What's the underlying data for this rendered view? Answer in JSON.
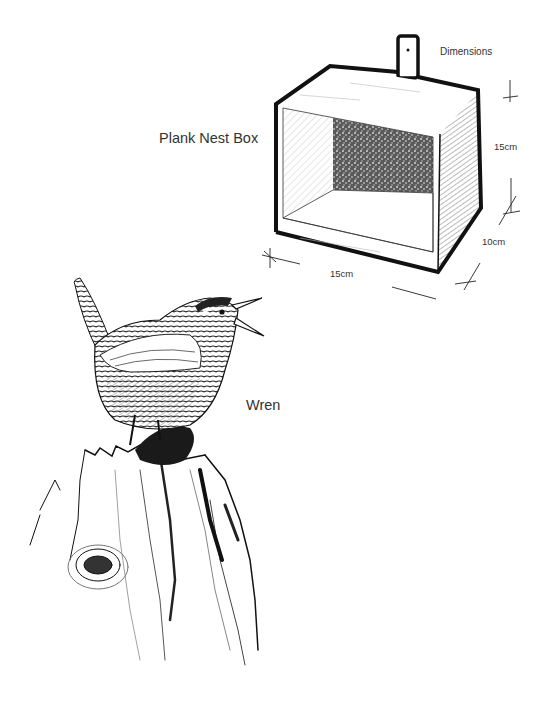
{
  "illustration": {
    "nest_box": {
      "title": "Plank Nest Box",
      "dimensions_heading": "Dimensions",
      "height": "15cm",
      "width": "15cm",
      "depth": "10cm"
    },
    "bird": {
      "name": "Wren"
    }
  },
  "colors": {
    "ink": "#111111",
    "text": "#333333",
    "background": "#ffffff"
  }
}
